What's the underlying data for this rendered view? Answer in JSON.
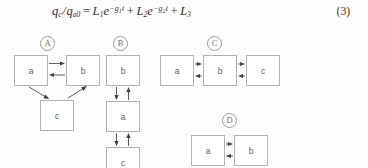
{
  "equation": {
    "lhs_numerator": "q",
    "lhs_num_sub": "c",
    "lhs_denominator": "q",
    "lhs_den_sub": "a0",
    "equals": "=",
    "term1_coeff": "L",
    "term1_sub": "1",
    "term1_base": "e",
    "term1_exp": "−g",
    "term1_exp_sub": "1",
    "term1_exp_var": "t",
    "plus1": "+",
    "term2_coeff": "L",
    "term2_sub": "2",
    "term2_base": "e",
    "term2_exp": "−g",
    "term2_exp_sub": "2",
    "term2_exp_var": "t",
    "plus2": "+",
    "term3_coeff": "L",
    "term3_sub": "3",
    "number": "(3)",
    "plain_text": "qc/qa0 = L1 e^(-g1 t) + L2 e^(-g2 t) + L3"
  },
  "diagrams": [
    {
      "id": "A",
      "label": "A",
      "layout": "triangle",
      "nodes": [
        {
          "id": "a",
          "label": "a"
        },
        {
          "id": "b",
          "label": "b"
        },
        {
          "id": "c",
          "label": "c"
        }
      ],
      "edges": [
        {
          "from": "a",
          "to": "b",
          "direction": "bidirectional",
          "orientation": "horizontal"
        },
        {
          "from": "a",
          "to": "c",
          "direction": "unidirectional",
          "orientation": "diagonal"
        },
        {
          "from": "c",
          "to": "b",
          "direction": "unidirectional",
          "orientation": "diagonal"
        }
      ]
    },
    {
      "id": "B",
      "label": "B",
      "layout": "vertical-chain",
      "nodes": [
        {
          "id": "b",
          "label": "b"
        },
        {
          "id": "a",
          "label": "a"
        },
        {
          "id": "c",
          "label": "c"
        }
      ],
      "edges": [
        {
          "from": "b",
          "to": "a",
          "direction": "bidirectional",
          "orientation": "vertical"
        },
        {
          "from": "a",
          "to": "c",
          "direction": "bidirectional",
          "orientation": "vertical"
        }
      ]
    },
    {
      "id": "C",
      "label": "C",
      "layout": "horizontal-chain",
      "nodes": [
        {
          "id": "a",
          "label": "a"
        },
        {
          "id": "b",
          "label": "b"
        },
        {
          "id": "c",
          "label": "c"
        }
      ],
      "edges": [
        {
          "from": "a",
          "to": "b",
          "direction": "bidirectional",
          "orientation": "horizontal"
        },
        {
          "from": "b",
          "to": "c",
          "direction": "bidirectional",
          "orientation": "horizontal"
        }
      ]
    },
    {
      "id": "D",
      "label": "D",
      "layout": "horizontal-pair",
      "nodes": [
        {
          "id": "a",
          "label": "a"
        },
        {
          "id": "b",
          "label": "b"
        }
      ],
      "edges": [
        {
          "from": "a",
          "to": "b",
          "direction": "bidirectional",
          "orientation": "horizontal"
        }
      ]
    }
  ],
  "colors": {
    "page_background": "#fdfdfd",
    "box_border": "#b2b2b2",
    "arrow": "#4d4d4d",
    "text": "#5d5d5d",
    "equation_text": "#2f2f2f",
    "circle_label": "#6f6f6f"
  }
}
